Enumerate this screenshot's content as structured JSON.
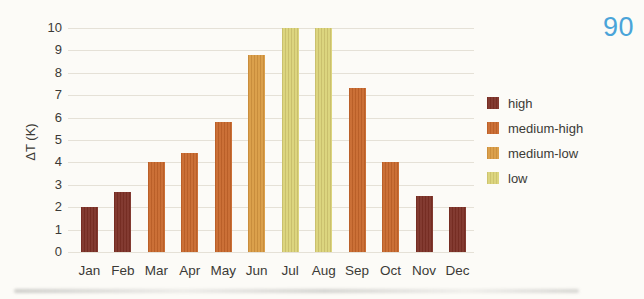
{
  "page": {
    "page_number": "90",
    "page_number_color": "#4aa4d9",
    "background_color": "#fcfbf7",
    "gridline_color": "#e5e1d7",
    "text_color": "#3b3a36"
  },
  "chart_data": {
    "type": "bar",
    "title": "",
    "xlabel": "",
    "ylabel": "ΔT (K)",
    "ylim": [
      0,
      10
    ],
    "yticks": [
      0,
      1,
      2,
      3,
      4,
      5,
      6,
      7,
      8,
      9,
      10
    ],
    "grid": true,
    "categories": [
      "Jan",
      "Feb",
      "Mar",
      "Apr",
      "May",
      "Jun",
      "Jul",
      "Aug",
      "Sep",
      "Oct",
      "Nov",
      "Dec"
    ],
    "values": [
      2.0,
      2.7,
      4.0,
      4.4,
      5.8,
      8.8,
      10,
      10,
      7.3,
      4.0,
      2.5,
      2.0
    ],
    "bar_categories": [
      "high",
      "high",
      "medium-high",
      "medium-high",
      "medium-high",
      "medium-low",
      "low",
      "low",
      "medium-high",
      "medium-high",
      "high",
      "high"
    ],
    "legend": {
      "position": "right",
      "entries": [
        {
          "label": "high",
          "color": "#7c3026"
        },
        {
          "label": "medium-high",
          "color": "#c8682c"
        },
        {
          "label": "medium-low",
          "color": "#d99b42"
        },
        {
          "label": "low",
          "color": "#dad378"
        }
      ]
    }
  }
}
